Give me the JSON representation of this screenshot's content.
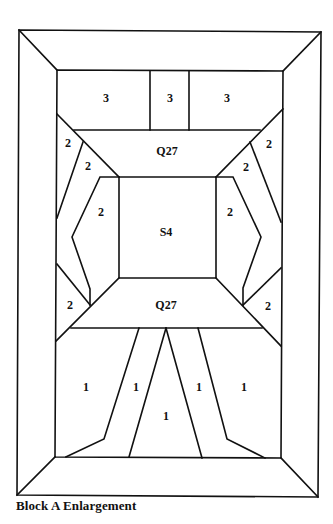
{
  "caption": "Block A Enlargement",
  "colors": {
    "line": "#111111",
    "background": "#ffffff"
  },
  "labels": [
    {
      "id": "top-left-3",
      "text": "3",
      "x": 106,
      "y": 99
    },
    {
      "id": "top-center-3",
      "text": "3",
      "x": 170,
      "y": 99
    },
    {
      "id": "top-right-3",
      "text": "3",
      "x": 227,
      "y": 99
    },
    {
      "id": "q27-top",
      "text": "Q27",
      "x": 167,
      "y": 152
    },
    {
      "id": "upper-left-outer-2",
      "text": "2",
      "x": 68,
      "y": 144
    },
    {
      "id": "upper-left-inner-2",
      "text": "2",
      "x": 88,
      "y": 167
    },
    {
      "id": "upper-right-outer-2",
      "text": "2",
      "x": 269,
      "y": 145
    },
    {
      "id": "upper-right-inner-2",
      "text": "2",
      "x": 246,
      "y": 168
    },
    {
      "id": "mid-left-2",
      "text": "2",
      "x": 101,
      "y": 213
    },
    {
      "id": "mid-right-2",
      "text": "2",
      "x": 230,
      "y": 213
    },
    {
      "id": "s4-center",
      "text": "S4",
      "x": 166,
      "y": 233
    },
    {
      "id": "lower-left-2",
      "text": "2",
      "x": 70,
      "y": 306
    },
    {
      "id": "lower-right-2",
      "text": "2",
      "x": 268,
      "y": 307
    },
    {
      "id": "q27-bottom",
      "text": "Q27",
      "x": 166,
      "y": 306
    },
    {
      "id": "bottom-left-1",
      "text": "1",
      "x": 86,
      "y": 388
    },
    {
      "id": "bottom-left-center-1",
      "text": "1",
      "x": 136,
      "y": 388
    },
    {
      "id": "bottom-center-1",
      "text": "1",
      "x": 166,
      "y": 417
    },
    {
      "id": "bottom-right-center-1",
      "text": "1",
      "x": 199,
      "y": 388
    },
    {
      "id": "bottom-right-1",
      "text": "1",
      "x": 244,
      "y": 388
    }
  ]
}
